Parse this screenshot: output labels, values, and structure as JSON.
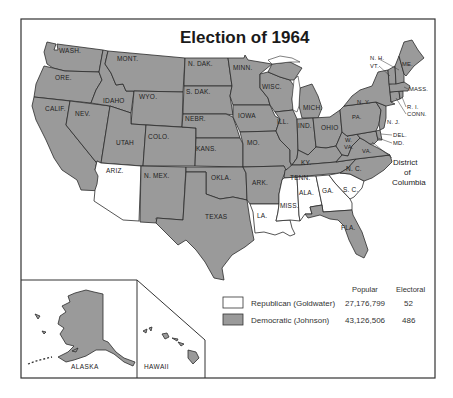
{
  "title": "Election of 1964",
  "colors": {
    "democratic": "#9a9a9a",
    "republican": "#ffffff",
    "border": "#2b2b2b"
  },
  "states": {
    "wash": "WASH.",
    "ore": "ORE.",
    "calif": "CALIF.",
    "nev": "NEV.",
    "idaho": "IDAHO",
    "mont": "MONT.",
    "wyo": "WYO.",
    "utah": "UTAH",
    "colo": "COLO.",
    "ariz": "ARIZ.",
    "nmex": "N. MEX.",
    "ndak": "N. DAK.",
    "sdak": "S. DAK.",
    "nebr": "NEBR.",
    "kans": "KANS.",
    "okla": "OKLA.",
    "texas": "TEXAS",
    "minn": "MINN.",
    "iowa": "IOWA",
    "mo": "MO.",
    "ark": "ARK.",
    "la": "LA.",
    "wisc": "WISC.",
    "ill": "ILL.",
    "mich": "MICH.",
    "ind": "IND.",
    "ohio": "OHIO",
    "ky": "KY.",
    "tenn": "TENN.",
    "miss": "MISS.",
    "ala": "ALA.",
    "ga": "GA.",
    "fla": "FLA.",
    "sc": "S. C.",
    "nc": "N. C.",
    "va": "VA.",
    "wva_1": "W.",
    "wva_2": "VA.",
    "pa": "PA.",
    "ny": "N. Y.",
    "nj": "N. J.",
    "del": "DEL.",
    "md": "MD.",
    "conn": "CONN.",
    "ri": "R. I.",
    "mass": "MASS.",
    "vt": "VT.",
    "nh": "N. H.",
    "me": "ME.",
    "dc_1": "District",
    "dc_2": "of",
    "dc_3": "Columbia",
    "alaska": "ALASKA",
    "hawaii": "HAWAII"
  },
  "winners": {
    "republican": [
      "ARIZ.",
      "LA.",
      "MISS.",
      "ALA.",
      "GA.",
      "S. C."
    ],
    "democratic": [
      "all other states",
      "District of Columbia",
      "ALASKA",
      "HAWAII"
    ]
  },
  "legend": {
    "header_popular": "Popular",
    "header_electoral": "Electoral",
    "rows": [
      {
        "party": "Republican (Goldwater)",
        "popular": "27,176,799",
        "electoral": "52",
        "swatch": "#ffffff"
      },
      {
        "party": "Democratic (Johnson)",
        "popular": "43,126,506",
        "electoral": "486",
        "swatch": "#9a9a9a"
      }
    ]
  }
}
